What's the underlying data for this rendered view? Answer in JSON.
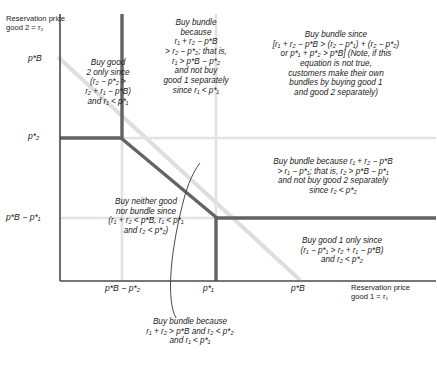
{
  "figure": {
    "type": "economics-bundling-diagram",
    "axes": {
      "y_label": "Reservation price\ngood 2 = r₂",
      "x_label": "Reservation price\ngood 1 = r₁",
      "y_ticks": [
        "p*B",
        "p*₂",
        "p*B − p*₁"
      ],
      "x_ticks": [
        "p*B − p*₂",
        "p*₁",
        "p*B"
      ]
    },
    "ticks": {
      "y_pB": "p*B",
      "y_p2": "p*₂",
      "y_pB_minus_p1": "p*B − p*₁",
      "x_pB_minus_p2": "p*B − p*₂",
      "x_p1": "p*₁",
      "x_pB": "p*B"
    },
    "regions": {
      "buy_good2_only": "Buy good\n2 only since\n(r₂ − p*₂ >\nr₂ + r₁ − p*B)\nand r₁ < p*₁",
      "buy_bundle_top": "Buy bundle\nbecause\nr₁ + r₂ − p*B\n> r₂ − p*₂; that is,\nr₁ > p*B − p*₂\nand not buy\ngood 1 separately\nsince r₁ < p*₁",
      "buy_bundle_upper_right": "Buy bundle since\n[r₁ + r₂ − p*B > (r₂ − p*₁) + (r₂ − p*₂)\nor p*₁ + p*₂ > p*B] (Note, if this\nequation is not true,\ncustomers make their own\nbundles by buying good 1\nand good 2 separately)",
      "buy_bundle_middle_right": "Buy bundle because r₁ + r₂ − p*B\n> r₁ − p*₁; that is, r₂ > p*B − p*₁\nand not buy good 2 separately\nsince r₂ < p*₂",
      "buy_neither": "Buy neither good\nnor bundle since\n(r₁ + r₂ < p*B, r₁ < p*₁\nand r₂ < p*₂)",
      "buy_good1_only": "Buy good 1 only since\n(r₁ − p*₁ > r₂ + r₁ − p*B)\nand r₂ < p*₂",
      "buy_bundle_bottom_callout": "Buy bundle because\nr₁ + r₂ > p*B and r₂ < p*₂\nand r₁ < p*₁"
    },
    "colors": {
      "boundary": "#595959",
      "gridline": "#d9d9d9",
      "budget_line": "#d9d9d9",
      "axis": "#3d3d3d",
      "text": "#1b1b1b",
      "background": "#ffffff"
    }
  }
}
